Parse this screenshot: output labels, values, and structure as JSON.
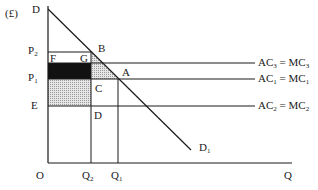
{
  "diagram": {
    "type": "economics-monopoly-cost-diagram",
    "y_axis_unit": "(£)",
    "axes": {
      "origin": "O",
      "x_label": "Q",
      "y_top_label": "D"
    },
    "price_labels": [
      {
        "id": "P2",
        "text": "P",
        "sub": "2"
      },
      {
        "id": "P1",
        "text": "P",
        "sub": "1"
      },
      {
        "id": "E",
        "text": "E",
        "sub": ""
      }
    ],
    "quantity_labels": [
      {
        "id": "Q2",
        "text": "Q",
        "sub": "2"
      },
      {
        "id": "Q1",
        "text": "Q",
        "sub": "1"
      }
    ],
    "point_labels": {
      "F": "F",
      "G": "G",
      "B": "B",
      "A": "A",
      "C": "C",
      "D": "D"
    },
    "demand_curve": {
      "text": "D",
      "sub": "1"
    },
    "cost_curves": [
      {
        "id": "AC3",
        "a": "AC",
        "a_sub": "3",
        "eq": "=",
        "b": "MC",
        "b_sub": "3"
      },
      {
        "id": "AC1",
        "a": "AC",
        "a_sub": "1",
        "eq": "=",
        "b": "MC",
        "b_sub": "1"
      },
      {
        "id": "AC2",
        "a": "AC",
        "a_sub": "2",
        "eq": "=",
        "b": "MC",
        "b_sub": "2"
      }
    ],
    "colors": {
      "line": "#1a1a1a",
      "black_area": "#111111",
      "stipple_area": "#c8c8c8"
    }
  }
}
